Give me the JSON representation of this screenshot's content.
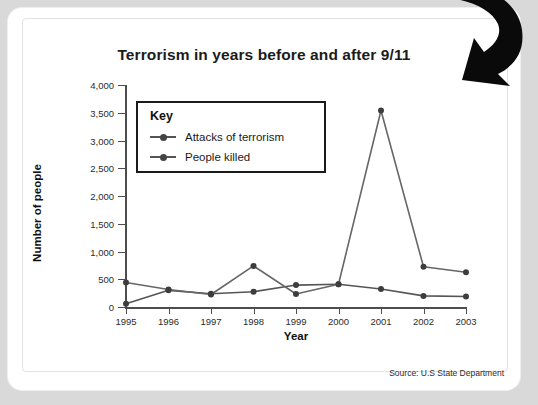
{
  "chart_data": {
    "type": "line",
    "title": "Terrorism in years before and after 9/11",
    "xlabel": "Year",
    "ylabel": "Number of people",
    "categories": [
      "1995",
      "1996",
      "1997",
      "1998",
      "1999",
      "2000",
      "2001",
      "2002",
      "2003"
    ],
    "x": [
      1995,
      1996,
      1997,
      1998,
      1999,
      2000,
      2001,
      2002,
      2003
    ],
    "ylim": [
      0,
      4000
    ],
    "xlim": [
      1995,
      2003
    ],
    "ytick_labels": [
      "0",
      "500",
      "1,000",
      "1,500",
      "2,000",
      "2,500",
      "3,000",
      "3,500",
      "4,000"
    ],
    "ytick_values": [
      0,
      500,
      1000,
      1500,
      2000,
      2500,
      3000,
      3500,
      4000
    ],
    "grid": false,
    "legend_position": "upper-left-inside",
    "legend_title": "Key",
    "series": [
      {
        "name": "Attacks of terrorism",
        "values": [
          60,
          300,
          240,
          275,
          395,
          410,
          325,
          200,
          190
        ],
        "color": "#555555"
      },
      {
        "name": "People killed",
        "values": [
          440,
          315,
          225,
          740,
          235,
          410,
          3540,
          725,
          625
        ],
        "color": "#666666"
      }
    ],
    "annotations": [
      "Source: U.S State Department"
    ]
  },
  "chart": {
    "title": "Terrorism in years before and after 9/11",
    "axis_title_x": "Year",
    "axis_title_y": "Number of people",
    "source_note": "Source: U.S State Department"
  },
  "legend": {
    "title": "Key",
    "items": [
      {
        "label": "Attacks of terrorism"
      },
      {
        "label": "People killed"
      }
    ]
  }
}
